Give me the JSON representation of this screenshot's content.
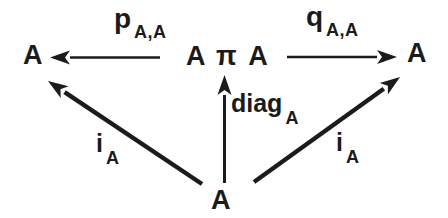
{
  "figure": {
    "type": "commutative-diagram",
    "background": "#ffffff",
    "ink": "#1b1b1b",
    "nodes": {
      "top_left": "A",
      "center": "A π A",
      "top_right": "A",
      "bottom": "A"
    },
    "arrow_labels": {
      "left_projection": {
        "main": "p",
        "sub": "A,A"
      },
      "right_projection": {
        "main": "q",
        "sub": "A,A"
      },
      "diagonal_map": {
        "main": "diag",
        "sub": "A"
      },
      "left_injection": {
        "main": "i",
        "sub": "A"
      },
      "right_injection": {
        "main": "i",
        "sub": "A"
      }
    },
    "arrows": [
      {
        "name": "left-projection-arrow",
        "from": "center",
        "to": "top_left",
        "direction": "left"
      },
      {
        "name": "right-projection-arrow",
        "from": "center",
        "to": "top_right",
        "direction": "right"
      },
      {
        "name": "diagonal-map-arrow",
        "from": "bottom",
        "to": "center",
        "direction": "up"
      },
      {
        "name": "left-injection-arrow",
        "from": "bottom",
        "to": "top_left",
        "direction": "up-left"
      },
      {
        "name": "right-injection-arrow",
        "from": "bottom",
        "to": "top_right",
        "direction": "up-right"
      }
    ]
  }
}
